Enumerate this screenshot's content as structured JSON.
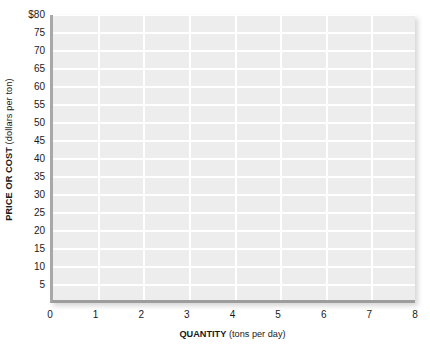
{
  "chart_data": {
    "type": "line",
    "title": "",
    "subtitle": "",
    "xlabel_bold": "QUANTITY",
    "xlabel_unit": "(tons per day)",
    "ylabel_bold": "PRICE OR COST",
    "ylabel_unit": "(dollars per ton)",
    "xlabel": "QUANTITY (tons per day)",
    "ylabel": "PRICE OR COST (dollars per ton)",
    "xlim": [
      0,
      8
    ],
    "ylim": [
      0,
      80
    ],
    "x_ticks": [
      0,
      1,
      2,
      3,
      4,
      5,
      6,
      7,
      8
    ],
    "x_tick_labels": [
      "0",
      "1",
      "2",
      "3",
      "4",
      "5",
      "6",
      "7",
      "8"
    ],
    "y_ticks": [
      5,
      10,
      15,
      20,
      25,
      30,
      35,
      40,
      45,
      50,
      55,
      60,
      65,
      70,
      75,
      80
    ],
    "y_tick_labels": [
      "5",
      "10",
      "15",
      "20",
      "25",
      "30",
      "35",
      "40",
      "45",
      "50",
      "55",
      "60",
      "65",
      "70",
      "75",
      "$80"
    ],
    "grid": true,
    "grid_color": "#ffffff",
    "plot_background": "#ededee",
    "axis_color": "#9d9d9d",
    "legend": [],
    "legend_position": "none",
    "series": [],
    "annotations": [],
    "note": "Blank graph grid with no plotted data series"
  },
  "colors": {
    "plot_background": "#ededee",
    "gridline": "#ffffff",
    "axis": "#9d9d9d",
    "text": "#1a1a1a",
    "page_background": "#ffffff"
  }
}
